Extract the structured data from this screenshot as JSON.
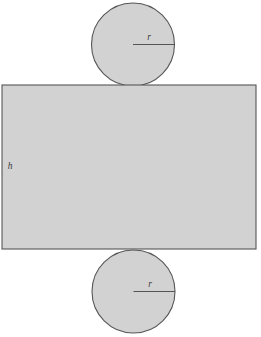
{
  "figure": {
    "kind": "cylinder-net",
    "background_color": "#ffffff",
    "fill_color": "#d2d2d2",
    "stroke_color": "#555555",
    "label_color": "#3a3a3a",
    "stroke_width": 1.1
  },
  "labels": {
    "radius_top": "r",
    "radius_bottom": "r",
    "height": "h"
  },
  "geometry": {
    "rectangle": {
      "x": 2,
      "y": 85,
      "width": 254,
      "height": 164
    },
    "circle_top": {
      "cx": 133,
      "cy": 44.5,
      "r": 41.5
    },
    "circle_bottom": {
      "cx": 133.5,
      "cy": 291.5,
      "r": 41.5
    },
    "radius_line_top": {
      "x1": 133,
      "y1": 44.5,
      "x2": 174.5,
      "y2": 44.5
    },
    "radius_line_bottom": {
      "x1": 133.5,
      "y1": 291.5,
      "x2": 175,
      "y2": 291.5
    },
    "label_positions": {
      "radius_top": {
        "x": 149,
        "y": 40
      },
      "radius_bottom": {
        "x": 150,
        "y": 287
      },
      "height": {
        "x": 10,
        "y": 169
      }
    }
  }
}
